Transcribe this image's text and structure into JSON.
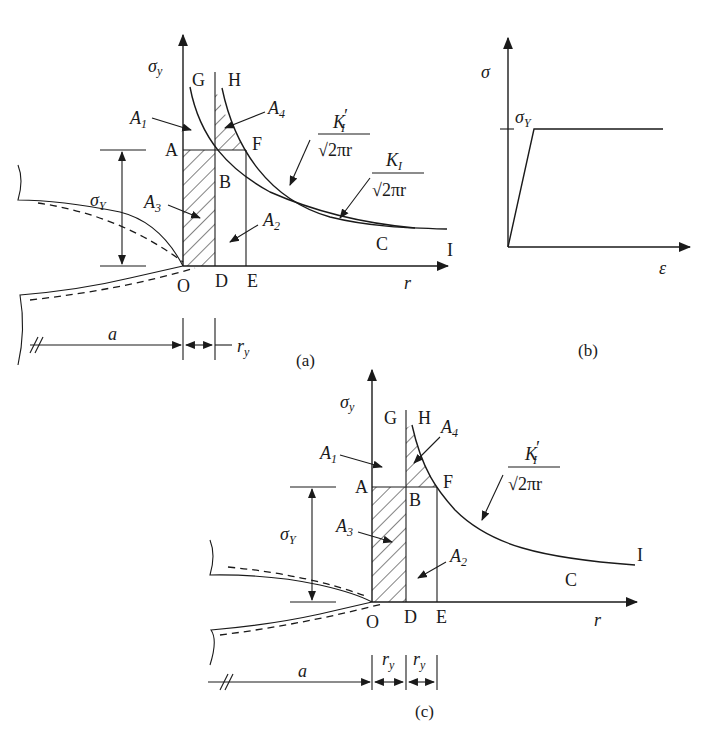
{
  "figure": {
    "panels": [
      {
        "id": "a",
        "caption": "(a)",
        "axis_y_label": "σ",
        "axis_y_sub": "y",
        "axis_x_label": "r",
        "points": {
          "G": "G",
          "H": "H",
          "A": "A",
          "B": "B",
          "F": "F",
          "O": "O",
          "D": "D",
          "E": "E",
          "C": "C",
          "I": "I"
        },
        "areas": {
          "A1": "A",
          "A1_sub": "1",
          "A2": "A",
          "A2_sub": "2",
          "A3": "A",
          "A3_sub": "3",
          "A4": "A",
          "A4_sub": "4"
        },
        "sigma_Y": "σ",
        "sigma_Y_sub": "Y",
        "dim_a": "a",
        "dim_ry": "r",
        "dim_ry_sub": "y",
        "curve1_num": "K",
        "curve1_num_sub": "I",
        "curve1_prime": "′",
        "curve1_den": "√2πr",
        "curve2_num": "K",
        "curve2_num_sub": "I",
        "curve2_den": "√2πr"
      },
      {
        "id": "b",
        "caption": "(b)",
        "axis_y_label": "σ",
        "axis_x_label": "ε",
        "yield_label": "σ",
        "yield_sub": "Y"
      },
      {
        "id": "c",
        "caption": "(c)",
        "axis_y_label": "σ",
        "axis_y_sub": "y",
        "axis_x_label": "r",
        "points": {
          "G": "G",
          "H": "H",
          "A": "A",
          "B": "B",
          "F": "F",
          "O": "O",
          "D": "D",
          "E": "E",
          "C": "C",
          "I": "I"
        },
        "areas": {
          "A1": "A",
          "A1_sub": "1",
          "A2": "A",
          "A2_sub": "2",
          "A3": "A",
          "A3_sub": "3",
          "A4": "A",
          "A4_sub": "4"
        },
        "sigma_Y": "σ",
        "sigma_Y_sub": "Y",
        "dim_a": "a",
        "dim_ry1": "r",
        "dim_ry1_sub": "y",
        "dim_ry2": "r",
        "dim_ry2_sub": "y",
        "curve1_num": "K",
        "curve1_num_sub": "I",
        "curve1_prime": "′",
        "curve1_den": "√2πr"
      }
    ]
  }
}
